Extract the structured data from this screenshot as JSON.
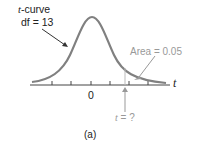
{
  "figure": {
    "curve_label_var": "t",
    "curve_label_rest": "-curve",
    "df_label": "df = 13",
    "area_label": "Area = 0.05",
    "axis_var": "t",
    "zero_label": "0",
    "critical_label_var": "t",
    "critical_label_rest": " = ?",
    "caption": "(a)"
  },
  "colors": {
    "curve": "#808080",
    "axis": "#444444",
    "annotation": "#999999",
    "shade_line": "#bbbbbb"
  }
}
